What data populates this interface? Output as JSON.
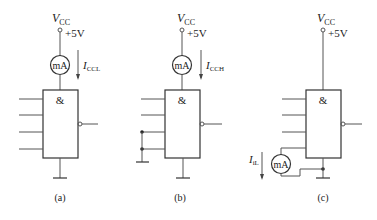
{
  "diagram": {
    "type": "gate-current-measurement-circuits",
    "panels": [
      {
        "id": "a",
        "caption": "(a)",
        "supply_label": "V",
        "supply_sub": "CC",
        "supply_value": "+5V",
        "meter_label": "mA",
        "current_label": "I",
        "current_sub": "CCL",
        "gate_symbol": "&",
        "inputs": "all open"
      },
      {
        "id": "b",
        "caption": "(b)",
        "supply_label": "V",
        "supply_sub": "CC",
        "supply_value": "+5V",
        "meter_label": "mA",
        "current_label": "I",
        "current_sub": "CCH",
        "gate_symbol": "&",
        "inputs": "two inputs grounded"
      },
      {
        "id": "c",
        "caption": "(c)",
        "supply_label": "V",
        "supply_sub": "CC",
        "supply_value": "+5V",
        "meter_label": "mA",
        "current_label": "I",
        "current_sub": "iL",
        "gate_symbol": "&",
        "inputs": "one input through meter to ground"
      }
    ]
  }
}
